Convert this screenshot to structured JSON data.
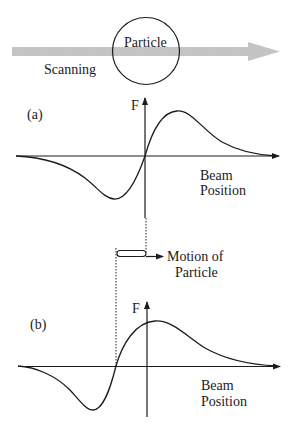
{
  "scan": {
    "particle_label": "Particle",
    "scanning_label": "Scanning"
  },
  "panel_a": {
    "label": "(a)",
    "y_axis_label": "F",
    "x_axis_label_line1": "Beam",
    "x_axis_label_line2": "Position"
  },
  "motion": {
    "label_line1": "Motion of",
    "label_line2": "Particle"
  },
  "panel_b": {
    "label": "(b)",
    "y_axis_label": "F",
    "x_axis_label_line1": "Beam",
    "x_axis_label_line2": "Position"
  },
  "colors": {
    "beam_arrow": "#c8c8c8",
    "ink": "#1c1c1c"
  }
}
